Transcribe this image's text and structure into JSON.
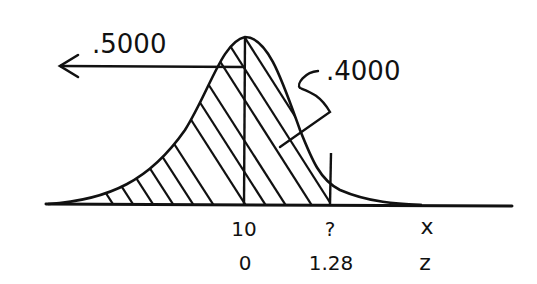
{
  "diagram": {
    "type": "normal-distribution-sketch",
    "labels": {
      "left_area": ".5000",
      "right_area": ".4000",
      "x_axis_label": "x",
      "z_axis_label": "z"
    },
    "ticks": [
      {
        "x_value": "10",
        "z_value": "0"
      },
      {
        "x_value": "?",
        "z_value": "1.28"
      }
    ],
    "shaded_region": "left tail to z = 1.28",
    "colors": {
      "ink": "#111111",
      "background": "#ffffff"
    }
  }
}
